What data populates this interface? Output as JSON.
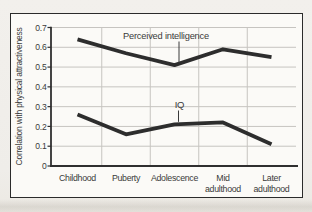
{
  "chart_data": {
    "type": "line",
    "title": "",
    "xlabel": "",
    "ylabel": "Correlation with physical attractiveness",
    "categories": [
      "Childhood",
      "Puberty",
      "Adolescence",
      "Mid adulthood",
      "Later adulthood"
    ],
    "categories_display": [
      [
        "Childhood"
      ],
      [
        "Puberty"
      ],
      [
        "Adolescence"
      ],
      [
        "Mid",
        "adulthood"
      ],
      [
        "Later",
        "adulthood"
      ]
    ],
    "series": [
      {
        "name": "Perceived intelligence",
        "values": [
          0.64,
          0.57,
          0.51,
          0.59,
          0.55
        ],
        "label_anchor_category": "Adolescence"
      },
      {
        "name": "IQ",
        "values": [
          0.26,
          0.16,
          0.21,
          0.22,
          0.11
        ],
        "label_anchor_category": "Adolescence"
      }
    ],
    "ylim": [
      0,
      0.7
    ],
    "y_ticks": [
      0,
      0.1,
      0.2,
      0.3,
      0.4,
      0.5,
      0.6,
      0.7
    ],
    "y_tick_labels": [
      "0",
      "0.1",
      "0.2",
      "0.3",
      "0.4",
      "0.5",
      "0.6",
      "0.7"
    ],
    "grid": true,
    "legend_position": "inline-annotations"
  },
  "colors": {
    "paper": "#efede9",
    "figure_bg": "#fbfaf7",
    "frame_border": "#2b2b2b",
    "gridline": "#c6c4c0",
    "axis": "#2f2f2f",
    "line": "#2d2d2d",
    "text": "#3a3a3a"
  }
}
